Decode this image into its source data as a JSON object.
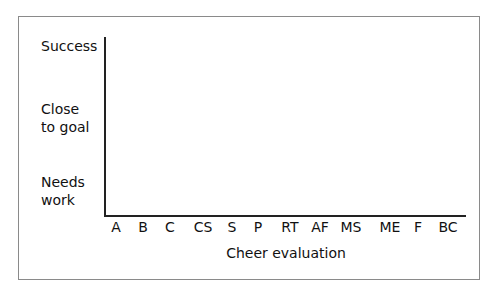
{
  "chart_data": {
    "type": "scatter",
    "title": "",
    "xlabel": "Cheer evaluation",
    "ylabel": "",
    "categories": [
      "A",
      "B",
      "C",
      "CS",
      "S",
      "P",
      "RT",
      "AF",
      "MS",
      "ME",
      "F",
      "BC"
    ],
    "y_levels": [
      "Needs work",
      "Close to goal",
      "Success"
    ],
    "series": [],
    "grid": false,
    "legend": null
  },
  "y_labels": [
    {
      "text": "Success",
      "top": 39
    },
    {
      "text": "Close\nto goal",
      "top": 103
    },
    {
      "text": "Needs\nwork",
      "top": 176
    }
  ],
  "x_ticks": [
    {
      "text": "A",
      "x": 116
    },
    {
      "text": "B",
      "x": 143
    },
    {
      "text": "C",
      "x": 170
    },
    {
      "text": "CS",
      "x": 203
    },
    {
      "text": "S",
      "x": 232
    },
    {
      "text": "P",
      "x": 258
    },
    {
      "text": "RT",
      "x": 290
    },
    {
      "text": "AF",
      "x": 320
    },
    {
      "text": "MS",
      "x": 351
    },
    {
      "text": "ME",
      "x": 390
    },
    {
      "text": "F",
      "x": 418
    },
    {
      "text": "BC",
      "x": 448
    }
  ]
}
